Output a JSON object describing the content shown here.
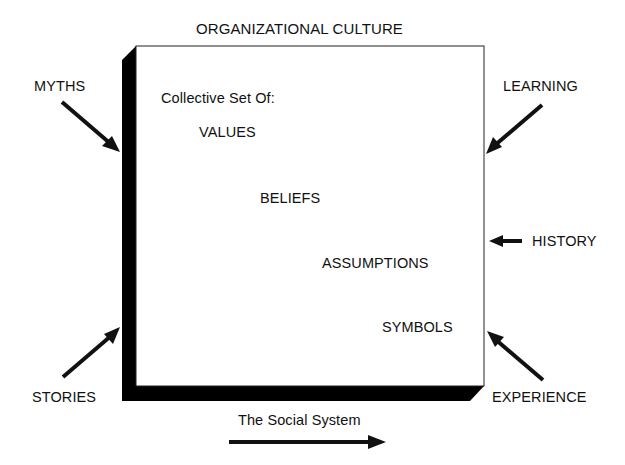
{
  "title": "ORGANIZATIONAL CULTURE",
  "box": {
    "heading": "Collective Set Of:",
    "items": [
      "VALUES",
      "BELIEFS",
      "ASSUMPTIONS",
      "SYMBOLS"
    ]
  },
  "influences": {
    "top_left": "MYTHS",
    "bottom_left": "STORIES",
    "top_right": "LEARNING",
    "middle_right": "HISTORY",
    "bottom_right": "EXPERIENCE"
  },
  "footer": {
    "label": "The Social System"
  },
  "colors": {
    "ink": "#111111",
    "box_face": "#ffffff",
    "box_shadow": "#000000"
  }
}
